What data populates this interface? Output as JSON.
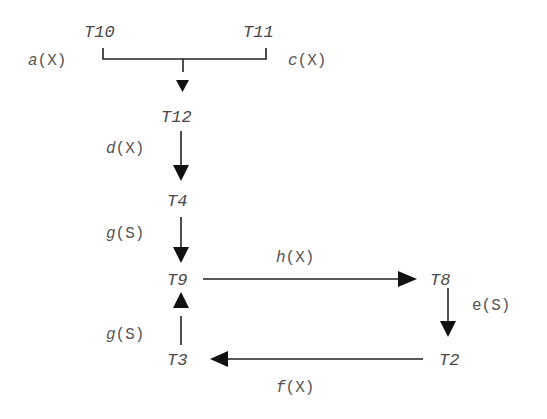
{
  "diagram": {
    "type": "transaction-precedence-graph",
    "nodes": {
      "t10": "T10",
      "t11": "T11",
      "t12": "T12",
      "t4": "T4",
      "t9": "T9",
      "t8": "T8",
      "t2": "T2",
      "t3": "T3"
    },
    "edges": [
      {
        "from": "T10",
        "to": "T12",
        "label_name": "a",
        "label_mode": "(X)"
      },
      {
        "from": "T11",
        "to": "T12",
        "label_name": "c",
        "label_mode": "(X)"
      },
      {
        "from": "T12",
        "to": "T4",
        "label_name": "d",
        "label_mode": "(X)"
      },
      {
        "from": "T4",
        "to": "T9",
        "label_name": "g",
        "label_mode": "(S)"
      },
      {
        "from": "T9",
        "to": "T8",
        "label_name": "h",
        "label_mode": "(X)"
      },
      {
        "from": "T8",
        "to": "T2",
        "label_name": "e",
        "label_mode": "(S)"
      },
      {
        "from": "T2",
        "to": "T3",
        "label_name": "f",
        "label_mode": "(X)"
      },
      {
        "from": "T3",
        "to": "T9",
        "label_name": "g",
        "label_mode": "(S)"
      }
    ],
    "colors": {
      "line": "#222222",
      "node_text": "#4a4a4a",
      "label_text": "#555555",
      "background": "#ffffff"
    }
  }
}
